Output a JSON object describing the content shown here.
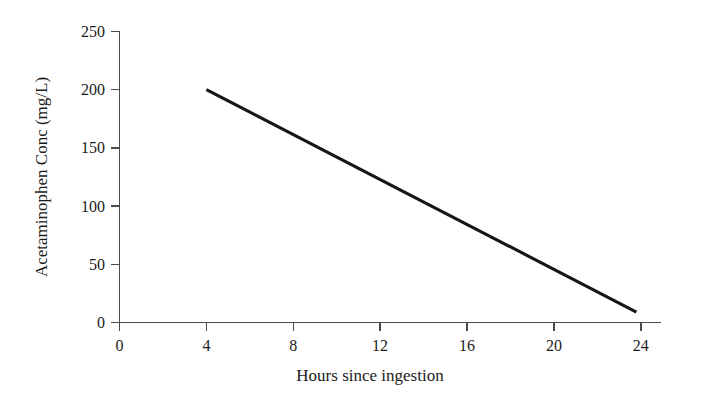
{
  "chart_data": {
    "type": "line",
    "title": "",
    "subtitle": "",
    "xlabel": "Hours since ingestion",
    "ylabel": "Acetaminophen Conc (mg/L)",
    "xlim": [
      0,
      25.2
    ],
    "ylim": [
      0,
      250
    ],
    "xticks": [
      0,
      4,
      8,
      12,
      16,
      20,
      24
    ],
    "xtick_labels": [
      "0",
      "4",
      "8",
      "12",
      "16",
      "20",
      "24"
    ],
    "yticks": [
      0,
      50,
      100,
      150,
      200,
      250
    ],
    "ytick_labels": [
      "0",
      "50",
      "100",
      "150",
      "200",
      "250"
    ],
    "grid": false,
    "legend": false,
    "legend_position": "none",
    "background_color": "#ffffff",
    "axis_color": "#4a4a4a",
    "text_color": "#1b1b1b",
    "series": [
      {
        "name": "Acetaminophen concentration",
        "color": "#161616",
        "line_width": 3.1,
        "x": [
          4,
          23.8
        ],
        "values": [
          200,
          9
        ],
        "points": [
          {
            "x": 4,
            "y": 200
          },
          {
            "x": 23.8,
            "y": 9
          }
        ]
      }
    ],
    "annotations": []
  },
  "axes": {
    "x_axis_label": "Hours since ingestion",
    "y_axis_label": "Acetaminophen Conc (mg/L)"
  }
}
